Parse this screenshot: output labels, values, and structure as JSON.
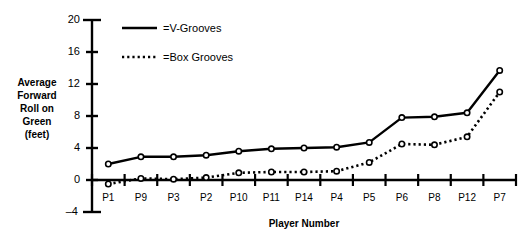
{
  "chart_data": {
    "type": "line",
    "title": "",
    "xlabel": "Player Number",
    "ylabel": "Average Forward Roll on Green (feet)",
    "ylabel_lines": [
      "Average",
      "Forward",
      "Roll on",
      "Green",
      "(feet)"
    ],
    "categories": [
      "P1",
      "P9",
      "P3",
      "P2",
      "P10",
      "P11",
      "P14",
      "P4",
      "P5",
      "P6",
      "P8",
      "P12",
      "P7"
    ],
    "yticks": [
      "20",
      "16",
      "12",
      "8",
      "4",
      "0",
      "–4"
    ],
    "ytick_values": [
      20,
      16,
      12,
      8,
      4,
      0,
      -4
    ],
    "ylim": [
      -4,
      20
    ],
    "grid": false,
    "legend_position": "top-center",
    "series": [
      {
        "name": "=V-Grooves",
        "style": "solid",
        "marker": "open-circle",
        "color": "#000000",
        "values": [
          2.0,
          2.9,
          2.9,
          3.1,
          3.6,
          3.9,
          4.0,
          4.1,
          4.7,
          7.8,
          7.9,
          8.4,
          13.7
        ]
      },
      {
        "name": "=Box Grooves",
        "style": "dotted",
        "marker": "open-circle",
        "color": "#000000",
        "values": [
          -0.5,
          0.2,
          0.1,
          0.3,
          0.9,
          1.0,
          1.0,
          1.1,
          2.2,
          4.5,
          4.4,
          5.4,
          11.0
        ]
      }
    ]
  },
  "legend": {
    "items": [
      {
        "label": "=V-Grooves",
        "style": "solid"
      },
      {
        "label": "=Box Grooves",
        "style": "dotted"
      }
    ]
  },
  "axes": {
    "x_title": "Player Number",
    "y_title_lines": [
      "Average",
      "Forward",
      "Roll on",
      "Green",
      "(feet)"
    ]
  }
}
